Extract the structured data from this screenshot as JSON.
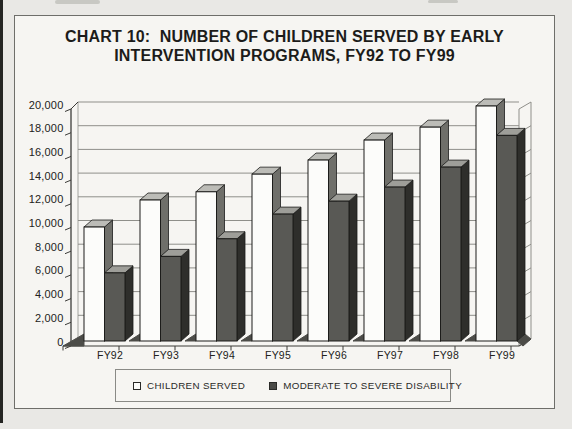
{
  "title": {
    "line1": "CHART 10:  NUMBER OF CHILDREN SERVED BY EARLY",
    "line2": "INTERVENTION PROGRAMS, FY92 TO FY99"
  },
  "chart_data": {
    "type": "bar",
    "style": "3d-clustered",
    "title": "CHART 10: NUMBER OF CHILDREN SERVED BY EARLY INTERVENTION PROGRAMS, FY92 TO FY99",
    "categories": [
      "FY92",
      "FY93",
      "FY94",
      "FY95",
      "FY96",
      "FY97",
      "FY98",
      "FY99"
    ],
    "series": [
      {
        "name": "CHILDREN SERVED",
        "values": [
          9700,
          12000,
          12700,
          14200,
          15400,
          17100,
          18200,
          20000
        ]
      },
      {
        "name": "MODERATE TO SEVERE DISABILITY",
        "values": [
          5800,
          7200,
          8700,
          10800,
          11900,
          13100,
          14800,
          17500
        ]
      }
    ],
    "xlabel": "",
    "ylabel": "",
    "ylim": [
      0,
      20000
    ],
    "y_tick_step": 2000,
    "y_tick_labels": [
      "0",
      "2,000",
      "4,000",
      "6,000",
      "8,000",
      "10,000",
      "12,000",
      "14,000",
      "16,000",
      "18,000",
      "20,000"
    ],
    "grid": true,
    "legend_position": "bottom"
  },
  "colors": {
    "children_front": "#fcfcfa",
    "children_top": "#bcbcb7",
    "children_side": "#6f6f6a",
    "moderate_front": "#595955",
    "moderate_top": "#9e9e99",
    "moderate_side": "#2e2e2b",
    "outline": "#1c1c1a",
    "gridline": "#8f8f8a",
    "axis": "#3c3c39",
    "floor": "#4c4c48",
    "text": "#222220",
    "page_bg": "#e9e8e5",
    "box_bg": "#f6f5f2"
  }
}
